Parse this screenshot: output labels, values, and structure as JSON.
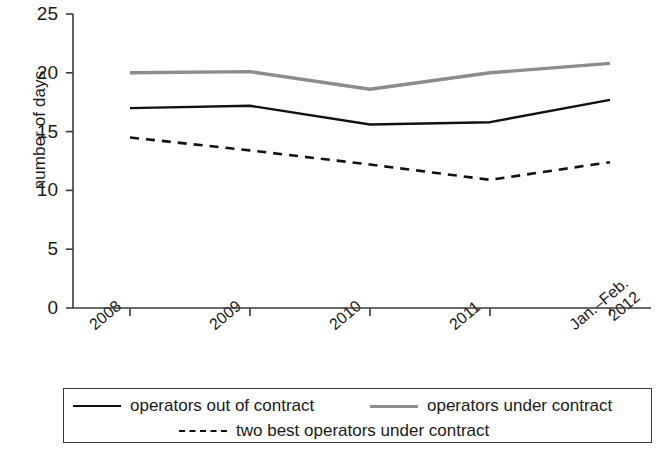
{
  "chart_data": {
    "type": "line",
    "title": "",
    "xlabel": "",
    "ylabel": "number of days",
    "categories": [
      "2008",
      "2009",
      "2010",
      "2011",
      "Jan.-Feb. 2012"
    ],
    "category_lines": [
      [
        "2008"
      ],
      [
        "2009"
      ],
      [
        "2010"
      ],
      [
        "2011"
      ],
      [
        "Jan.–Feb.",
        "2012"
      ]
    ],
    "ylim": [
      0,
      25
    ],
    "yticks": [
      0,
      5,
      10,
      15,
      20,
      25
    ],
    "ytick_labels": [
      "0",
      "5",
      "10",
      "15",
      "20",
      "25"
    ],
    "grid": false,
    "legend_position": "bottom",
    "series": [
      {
        "name": "operators out of contract",
        "style": "solid",
        "color": "#111111",
        "values": [
          17.0,
          17.2,
          15.6,
          15.8,
          17.7
        ]
      },
      {
        "name": "operators under contract",
        "style": "solid",
        "color": "#8d8d8d",
        "values": [
          20.0,
          20.1,
          18.6,
          20.0,
          20.8
        ]
      },
      {
        "name": "two best operators under contract",
        "style": "dashed",
        "color": "#111111",
        "values": [
          14.5,
          13.4,
          12.2,
          10.9,
          12.4
        ]
      }
    ]
  },
  "axis": {
    "y_title": "number of days"
  },
  "legend": {
    "items": [
      {
        "label": "operators out of contract",
        "style": "solid",
        "color": "#111111"
      },
      {
        "label": "operators under contract",
        "style": "solid",
        "color": "#8d8d8d"
      },
      {
        "label": "two best operators under contract",
        "style": "dashed",
        "color": "#111111"
      }
    ]
  },
  "colors": {
    "axis": "#3a3a3a",
    "series_black": "#111111",
    "series_gray": "#8d8d8d",
    "text": "#1a1a1a",
    "background": "#ffffff"
  }
}
